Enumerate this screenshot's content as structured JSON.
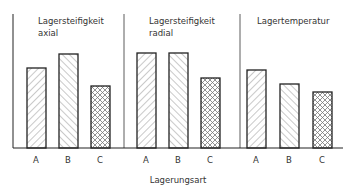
{
  "chart_data": {
    "type": "bar",
    "xlabel": "Lagerungsart",
    "ylabel": "",
    "grid": false,
    "legend": null,
    "categories": [
      "A",
      "B",
      "C"
    ],
    "panels": [
      {
        "title_line1": "Lagersteifigkeit",
        "title_line2": "axial",
        "values": [
          80,
          94,
          62
        ],
        "patterns": [
          "diag-up",
          "diag-down",
          "crosshatch"
        ]
      },
      {
        "title_line1": "Lagersteifigkeit",
        "title_line2": "radial",
        "values": [
          95,
          95,
          70
        ],
        "patterns": [
          "diag-up",
          "diag-down",
          "crosshatch"
        ]
      },
      {
        "title_line1": "Lagertemperatur",
        "title_line2": "",
        "values": [
          78,
          64,
          56
        ],
        "patterns": [
          "diag-up",
          "diag-down",
          "crosshatch"
        ]
      }
    ],
    "value_scale_note": "relative bar heights (no y-axis values shown)",
    "ylim": [
      0,
      100
    ]
  },
  "colors": {
    "line": "#222222",
    "hatch": "#666666",
    "background": "#ffffff"
  }
}
